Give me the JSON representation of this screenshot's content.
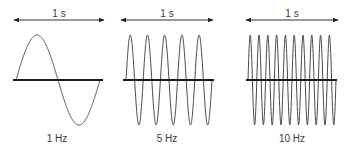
{
  "diagram": {
    "type": "frequency-comparison",
    "colors": {
      "wave": "#4a4a4a",
      "axis": "#1a1a1a",
      "arrow": "#333333",
      "text": "#3a3a3a"
    },
    "panels": [
      {
        "duration_label": "1 s",
        "frequency_label": "1 Hz",
        "cycles": 1,
        "axis": {
          "x0": 13,
          "x1": 103,
          "y": 80
        },
        "wave": {
          "x0": 16,
          "x1": 100,
          "amp": 45
        },
        "arrow": {
          "x0": 14,
          "x1": 104,
          "y": 20
        }
      },
      {
        "duration_label": "1 s",
        "frequency_label": "5 Hz",
        "cycles": 5,
        "axis": {
          "x0": 123,
          "x1": 214,
          "y": 80
        },
        "wave": {
          "x0": 126,
          "x1": 212,
          "amp": 45
        },
        "arrow": {
          "x0": 121,
          "x1": 213,
          "y": 20
        }
      },
      {
        "duration_label": "1 s",
        "frequency_label": "10 Hz",
        "cycles": 10,
        "axis": {
          "x0": 246,
          "x1": 337,
          "y": 80
        },
        "wave": {
          "x0": 248,
          "x1": 336,
          "amp": 45
        },
        "arrow": {
          "x0": 246,
          "x1": 338,
          "y": 20
        }
      }
    ]
  }
}
